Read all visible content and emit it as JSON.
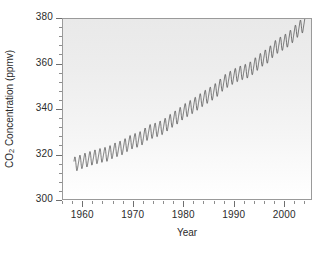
{
  "chart_data": {
    "type": "line",
    "title": "",
    "subtitle": "",
    "xlabel": "Year",
    "ylabel": "CO2 Concentration (ppmv)",
    "ylabel_prefix": "CO",
    "ylabel_subscript": "2",
    "ylabel_suffix": " Concentration (ppmv)",
    "xlim": [
      1956.0,
      2005.5
    ],
    "ylim": [
      300,
      380
    ],
    "x_major_ticks": [
      1960,
      1970,
      1980,
      1990,
      2000
    ],
    "x_tick_labels": [
      "1960",
      "1970",
      "1980",
      "1990",
      "2000"
    ],
    "x_minor_interval": 2,
    "y_major_ticks": [
      300,
      320,
      340,
      360,
      380
    ],
    "y_tick_labels": [
      "300",
      "320",
      "340",
      "360",
      "380"
    ],
    "y_minor_interval": 4,
    "grid": false,
    "legend": null,
    "line_color": "#3c3c3c",
    "plot_background": "#eeeeee",
    "frame_color": "#9a9a9a",
    "series": [
      {
        "name": "Mauna Loa atmospheric CO2 (monthly mean)",
        "description": "Keeling Curve: rising trend with annual seasonal sawtooth oscillation of roughly 6 ppmv peak-to-peak",
        "seasonal_amplitude_ppmv": 3.0,
        "seasonal_peak_month": 5,
        "seasonal_trough_month": 10,
        "x_start": 1958.2,
        "x_end": 2004.4,
        "annual_mean_x": [
          1958,
          1959,
          1960,
          1961,
          1962,
          1963,
          1964,
          1965,
          1966,
          1967,
          1968,
          1969,
          1970,
          1971,
          1972,
          1973,
          1974,
          1975,
          1976,
          1977,
          1978,
          1979,
          1980,
          1981,
          1982,
          1983,
          1984,
          1985,
          1986,
          1987,
          1988,
          1989,
          1990,
          1991,
          1992,
          1993,
          1994,
          1995,
          1996,
          1997,
          1998,
          1999,
          2000,
          2001,
          2002,
          2003,
          2004
        ],
        "annual_mean_y": [
          315.3,
          315.9,
          316.9,
          317.6,
          318.4,
          319.0,
          319.6,
          320.0,
          321.4,
          322.2,
          323.0,
          324.6,
          325.7,
          326.3,
          327.5,
          329.7,
          330.2,
          331.1,
          332.0,
          333.8,
          335.4,
          336.8,
          338.7,
          340.1,
          341.4,
          343.0,
          344.6,
          346.0,
          347.4,
          349.2,
          351.6,
          353.1,
          354.4,
          355.6,
          356.4,
          357.1,
          358.8,
          360.8,
          362.6,
          363.8,
          366.6,
          368.3,
          369.5,
          371.0,
          373.1,
          375.6,
          377.4
        ]
      }
    ]
  },
  "figure": {
    "background": "#ffffff"
  }
}
